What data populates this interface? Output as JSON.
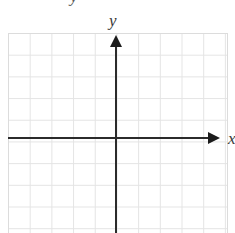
{
  "figure": {
    "kind": "blank-cartesian-coordinate-grid",
    "background_color": "#ffffff"
  },
  "labels": {
    "y_axis": "y",
    "x_axis": "x",
    "top_fragment": "y"
  },
  "colors": {
    "grid_line": "#e4e4e4",
    "grid_border": "#dcdcdc",
    "axis": "#2b2b2b",
    "arrowhead": "#1c1c1c",
    "label_text": "#3a3a3a"
  },
  "chart_data": {
    "type": "scatter",
    "title": "",
    "subtitle": "",
    "xlabel": "x",
    "ylabel": "y",
    "xlim": [
      -5,
      5
    ],
    "ylim": [
      -4.5,
      5
    ],
    "grid": true,
    "grid_spacing": 1,
    "legend": "none",
    "origin_shown": true,
    "axis_arrows": {
      "x_positive": true,
      "x_negative": false,
      "y_positive": true,
      "y_negative": false
    },
    "tick_labels": {
      "x": [],
      "y": []
    },
    "series": [
      {
        "name": "",
        "x": [],
        "y": []
      }
    ],
    "annotations": [],
    "note": "Empty graph paper: no plotted data points, no numeric tick labels."
  }
}
